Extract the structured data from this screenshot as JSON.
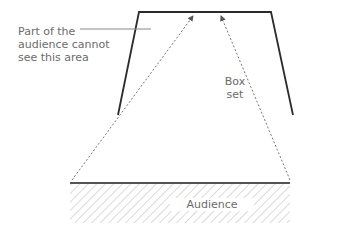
{
  "diagram": {
    "labels": {
      "obstructed_note": "Part of the audience cannot see this area",
      "box_set_line1": "Box",
      "box_set_line2": "set",
      "audience": "Audience"
    },
    "colors": {
      "wall": "#2b2b2b",
      "sightline": "#7a7a7a",
      "hatch": "#b5b5b5",
      "text": "#6b6b6b"
    }
  }
}
